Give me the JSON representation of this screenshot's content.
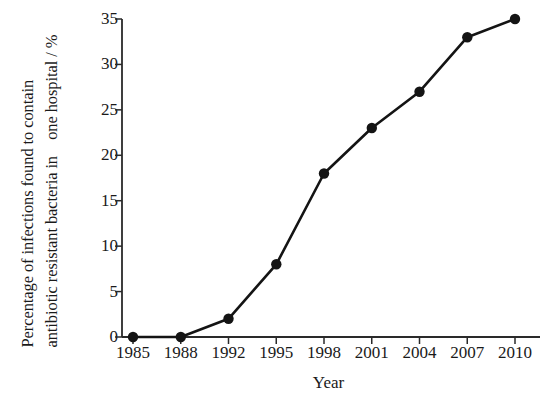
{
  "chart_data": {
    "type": "line",
    "title": "",
    "xlabel": "Year",
    "ylabel": "Percentage of infections found to contain antibiotic resistant bacteria in one hospital / %",
    "ylabel_lines": [
      "Percentage of infections found to contain",
      "antibiotic resistant bacteria in",
      "one hospital / %"
    ],
    "categories": [
      "1985",
      "1988",
      "1992",
      "1995",
      "1998",
      "2001",
      "2004",
      "2007",
      "2010"
    ],
    "x": [
      1985,
      1988,
      1992,
      1995,
      1998,
      2001,
      2004,
      2007,
      2010
    ],
    "values": [
      0,
      0,
      2,
      8,
      18,
      23,
      27,
      33,
      35
    ],
    "series": [
      {
        "name": "Percentage of resistant infections",
        "values": [
          0,
          0,
          2,
          8,
          18,
          23,
          27,
          33,
          35
        ]
      }
    ],
    "yticks": [
      0,
      5,
      10,
      15,
      20,
      25,
      30,
      35
    ],
    "ytick_labels": [
      "0",
      "5",
      "10",
      "15",
      "20",
      "25",
      "30",
      "35"
    ],
    "ylim": [
      0,
      35
    ],
    "xtick_labels": [
      "1985",
      "1988",
      "1992",
      "1995",
      "1998",
      "2001",
      "2004",
      "2007",
      "2010"
    ],
    "grid": false,
    "legend": "none",
    "marker": "filled-circle",
    "line_color": "#141414",
    "marker_color": "#141414",
    "axis_color": "#2a2a2a",
    "background_color": "#ffffff"
  },
  "axis": {
    "y_title_line_1": "Percentage of infections found to contain",
    "y_title_line_2": "antibiotic resistant bacteria in",
    "y_title_line_3": "one hospital / %",
    "x_title": "Year"
  }
}
